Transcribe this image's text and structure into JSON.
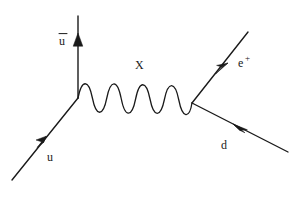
{
  "figure": {
    "type": "feynman-diagram",
    "width": 304,
    "height": 200,
    "background_color": "#ffffff",
    "line_color": "#1a1a1a"
  },
  "labels": {
    "u_bar": "u",
    "u_bar_overbar": true,
    "boson": "X",
    "positron_base": "e",
    "positron_sup": "+",
    "up_quark": "u",
    "down_quark": "d"
  },
  "lines": [
    {
      "name": "incoming-up-quark",
      "label": "u",
      "style": "fermion",
      "from": [
        12,
        180
      ],
      "to": [
        78,
        98
      ],
      "arrow_at": [
        45,
        139
      ],
      "arrow_direction": "up-right"
    },
    {
      "name": "outgoing-anti-up-quark",
      "label": "u-bar",
      "style": "fermion",
      "from": [
        78,
        98
      ],
      "to": [
        78,
        16
      ],
      "arrow_at": [
        78,
        42
      ],
      "arrow_direction": "up"
    },
    {
      "name": "exchange-boson-x",
      "label": "X",
      "style": "boson-wave",
      "from": [
        78,
        98
      ],
      "to": [
        192,
        103
      ],
      "periods": 5,
      "amplitude": 19
    },
    {
      "name": "outgoing-positron",
      "label": "e+",
      "style": "fermion",
      "from": [
        192,
        103
      ],
      "to": [
        248,
        32
      ],
      "arrow_at": [
        222,
        70
      ],
      "arrow_direction": "up-right"
    },
    {
      "name": "outgoing-down-quark",
      "label": "d",
      "style": "fermion",
      "from": [
        192,
        103
      ],
      "to": [
        288,
        152
      ],
      "arrow_at": [
        240,
        128
      ],
      "arrow_direction": "up-left"
    }
  ],
  "vertices": [
    {
      "name": "left-vertex",
      "at": [
        78,
        98
      ]
    },
    {
      "name": "right-vertex",
      "at": [
        192,
        103
      ]
    }
  ],
  "label_positions": {
    "u_bar": [
      58,
      44
    ],
    "boson": [
      135,
      68
    ],
    "positron": [
      238,
      66
    ],
    "up_quark": [
      47,
      160
    ],
    "down_quark": [
      221,
      148
    ]
  }
}
